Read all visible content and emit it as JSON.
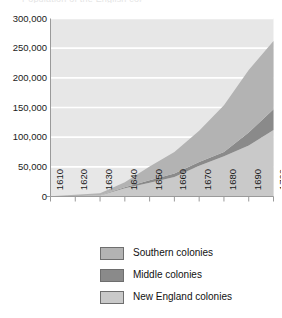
{
  "figure": {
    "title_fragment": "Population of the English colonies",
    "background_color": "#ffffff"
  },
  "chart_data": {
    "type": "area",
    "stacked": true,
    "title": "",
    "subtitle": "",
    "xlabel": "",
    "ylabel": "",
    "x": [
      1610,
      1620,
      1630,
      1640,
      1650,
      1660,
      1670,
      1680,
      1690,
      1700
    ],
    "categories": [
      "1610",
      "1620",
      "1630",
      "1640",
      "1650",
      "1660",
      "1670",
      "1680",
      "1690",
      "1700"
    ],
    "xlim": [
      1610,
      1700
    ],
    "ylim": [
      0,
      300000
    ],
    "ytick_labels": [
      "300,000",
      "250,000",
      "200,000",
      "150,000",
      "100,000",
      "50,000",
      "0"
    ],
    "ytick_values": [
      300000,
      250000,
      200000,
      150000,
      100000,
      50000,
      0
    ],
    "ytick_step": 50000,
    "grid": "horizontal",
    "grid_color": "#ffffff",
    "plot_background": "#e7e7e7",
    "axis_color": "#9a9a9a",
    "legend_position": "below",
    "stack_order_bottom_to_top": [
      "New England colonies",
      "Middle colonies",
      "Southern colonies"
    ],
    "series": [
      {
        "name": "New England colonies",
        "color": "#c9c9c9",
        "values": [
          0,
          500,
          1800,
          13700,
          23000,
          33000,
          52000,
          68000,
          86000,
          112000
        ]
      },
      {
        "name": "Middle colonies",
        "color": "#8a8a8a",
        "values": [
          0,
          0,
          500,
          1900,
          4500,
          5900,
          6000,
          7000,
          22000,
          35000
        ]
      },
      {
        "name": "Southern colonies",
        "color": "#b3b3b3",
        "values": [
          350,
          2300,
          3000,
          8400,
          23000,
          36000,
          53000,
          79000,
          105000,
          115000
        ]
      }
    ],
    "totals": [
      350,
      2800,
      5300,
      24000,
      50500,
      74900,
      111000,
      154000,
      213000,
      262000
    ]
  },
  "legend": {
    "items": [
      {
        "label": "Southern colonies",
        "color": "#b3b3b3"
      },
      {
        "label": "Middle colonies",
        "color": "#8a8a8a"
      },
      {
        "label": "New England colonies",
        "color": "#c9c9c9"
      }
    ]
  }
}
